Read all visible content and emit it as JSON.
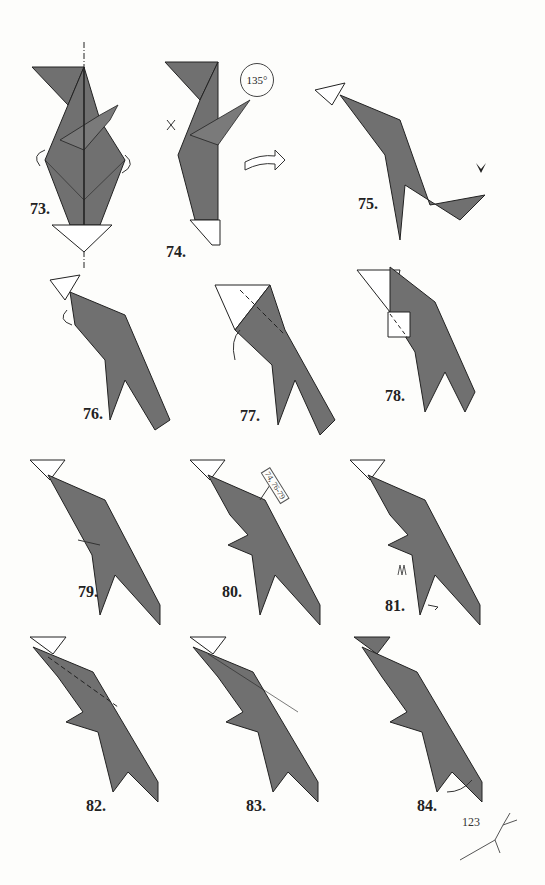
{
  "page": {
    "number": "123"
  },
  "colors": {
    "paper_gray": "#6f6f6f",
    "paper_white": "#ffffff",
    "line": "#222222",
    "background": "#fdfdfb"
  },
  "steps": [
    {
      "label": "73."
    },
    {
      "label": "74.",
      "rotation_badge": "135°"
    },
    {
      "label": "75."
    },
    {
      "label": "76."
    },
    {
      "label": "77."
    },
    {
      "label": "78."
    },
    {
      "label": "79."
    },
    {
      "label": "80.",
      "reference": "74, 76-79"
    },
    {
      "label": "81."
    },
    {
      "label": "82."
    },
    {
      "label": "83."
    },
    {
      "label": "84."
    }
  ],
  "icons": {
    "turn_over": "curved-arrow-icon",
    "rotate": "rotate-icon",
    "push": "push-arrow-icon",
    "mark": "x-mark-icon"
  }
}
